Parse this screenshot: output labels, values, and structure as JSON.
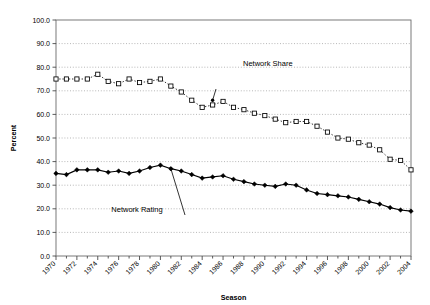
{
  "chart_data": {
    "type": "line",
    "title": "",
    "xlabel": "Season",
    "ylabel": "Percent",
    "ylim": [
      0,
      100
    ],
    "ytick_step": 10,
    "ytick_labels": [
      "0.0",
      "10.0",
      "20.0",
      "30.0",
      "40.0",
      "50.0",
      "60.0",
      "70.0",
      "80.0",
      "90.0",
      "100.0"
    ],
    "xlim": [
      1970,
      2004
    ],
    "xtick_labels": [
      "1970",
      "1972",
      "1974",
      "1976",
      "1978",
      "1980",
      "1982",
      "1984",
      "1986",
      "1988",
      "1990",
      "1992",
      "1994",
      "1996",
      "1998",
      "2000",
      "2002",
      "2004"
    ],
    "xtick_step": 2,
    "xminor_step": 1,
    "grid": "horizontal-dotted",
    "legend": "none",
    "x": [
      1970,
      1971,
      1972,
      1973,
      1974,
      1975,
      1976,
      1977,
      1978,
      1979,
      1980,
      1981,
      1982,
      1983,
      1984,
      1985,
      1986,
      1987,
      1988,
      1989,
      1990,
      1991,
      1992,
      1993,
      1994,
      1995,
      1996,
      1997,
      1998,
      1999,
      2000,
      2001,
      2002,
      2003,
      2004
    ],
    "series": [
      {
        "name": "Network Share",
        "marker": "open-square",
        "line_style": "dotted",
        "color": "#000000",
        "values": [
          75.0,
          75.0,
          75.0,
          75.0,
          77.0,
          74.0,
          73.0,
          75.0,
          73.5,
          74.0,
          75.0,
          72.0,
          69.5,
          66.0,
          63.0,
          64.0,
          65.5,
          63.0,
          62.0,
          60.5,
          59.5,
          58.0,
          56.5,
          57.0,
          57.0,
          55.0,
          52.5,
          50.0,
          49.5,
          48.0,
          47.0,
          45.0,
          41.0,
          40.5,
          36.5
        ]
      },
      {
        "name": "Network Rating",
        "marker": "filled-diamond",
        "line_style": "solid",
        "color": "#000000",
        "values": [
          35.0,
          34.5,
          36.5,
          36.5,
          36.5,
          35.5,
          36.0,
          35.0,
          36.0,
          37.5,
          38.5,
          37.0,
          36.0,
          34.5,
          33.0,
          33.5,
          34.0,
          32.5,
          31.5,
          30.5,
          30.0,
          29.5,
          30.5,
          30.0,
          28.0,
          26.5,
          26.0,
          25.5,
          25.0,
          24.0,
          23.0,
          22.0,
          20.5,
          19.5,
          19.0
        ]
      }
    ],
    "annotations": [
      {
        "label": "Network Share",
        "target_x": 1985,
        "target_y": 66.0
      },
      {
        "label": "Network Rating",
        "target_x": 1981,
        "target_y": 37.0
      }
    ]
  }
}
